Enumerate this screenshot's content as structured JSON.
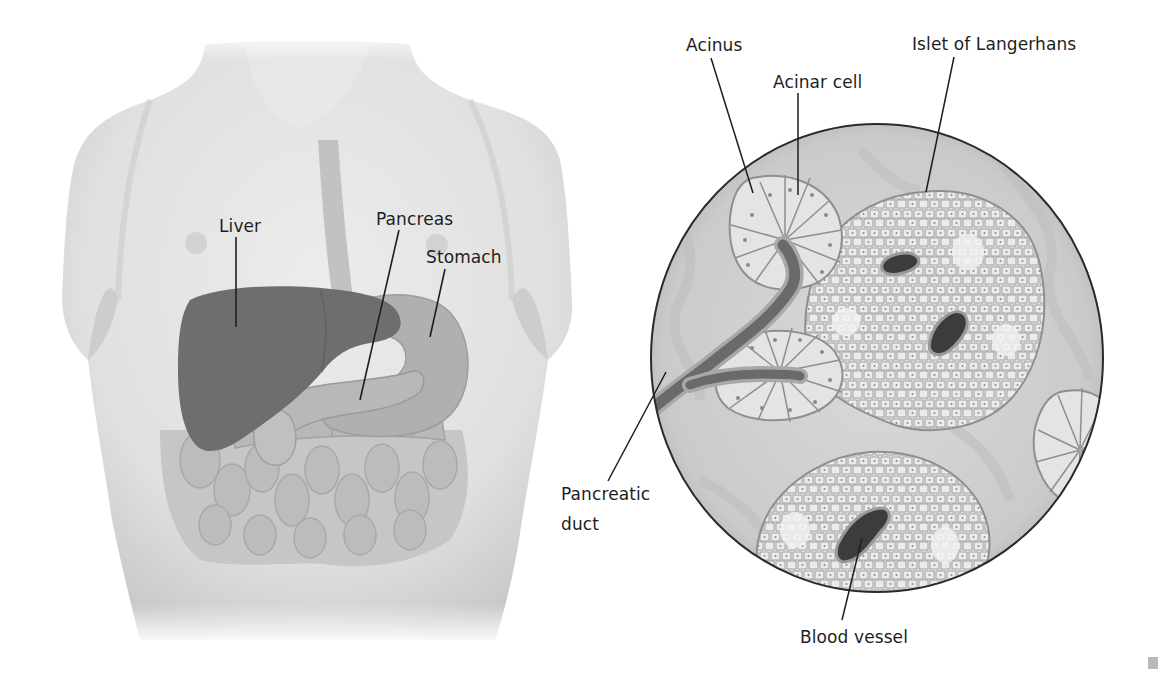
{
  "figure": {
    "left_panel": {
      "name": "torso",
      "labels": [
        {
          "id": "liver",
          "text": "Liver",
          "x": 219,
          "y": 216,
          "line": [
            236,
            237,
            236,
            327
          ]
        },
        {
          "id": "pancreas",
          "text": "Pancreas",
          "x": 376,
          "y": 209,
          "line": [
            399,
            230,
            360,
            400
          ]
        },
        {
          "id": "stomach",
          "text": "Stomach",
          "x": 426,
          "y": 247,
          "line": [
            445,
            269,
            430,
            337
          ]
        }
      ]
    },
    "right_panel": {
      "name": "pancreas-tissue-magnified",
      "circle": {
        "cx": 877,
        "cy": 358,
        "rx": 226,
        "ry": 234
      },
      "labels": [
        {
          "id": "acinus",
          "text": "Acinus",
          "x": 686,
          "y": 35,
          "line": [
            711,
            58,
            753,
            193
          ]
        },
        {
          "id": "acinar-cell",
          "text": "Acinar cell",
          "x": 773,
          "y": 72,
          "line": [
            798,
            93,
            798,
            195
          ]
        },
        {
          "id": "islet-of-langerhans",
          "text": "Islet of Langerhans",
          "x": 912,
          "y": 34,
          "line": [
            954,
            57,
            926,
            192
          ]
        },
        {
          "id": "pancreatic-duct",
          "text": "Pancreatic\nduct",
          "x": 561,
          "y": 479,
          "line": [
            608,
            481,
            666,
            372
          ]
        },
        {
          "id": "blood-vessel",
          "text": "Blood vessel",
          "x": 800,
          "y": 627,
          "line": [
            842,
            620,
            862,
            538
          ]
        }
      ]
    },
    "colors": {
      "background": "#ffffff",
      "skin": "#e4e4e4",
      "skin_shadow": "#cfcfcf",
      "liver": "#6e6e6e",
      "stomach": "#a9a9a9",
      "pancreas": "#b4b4b4",
      "intestine": "#bdbdbd",
      "tissue_bg": "#d2d2d2",
      "cell_fill": "#e6e6e6",
      "cell_stroke": "#8f8f8f",
      "duct": "#6a6a6a",
      "vessel": "#3c3c3c",
      "line": "#1e1e1e",
      "text": "#1e1e1e"
    }
  }
}
